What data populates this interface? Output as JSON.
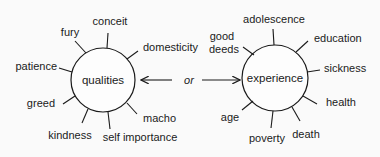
{
  "diagram": {
    "left": {
      "center": "qualities",
      "spokes": [
        "conceit",
        "fury",
        "domesticity",
        "patience",
        "greed",
        "kindness",
        "self importance",
        "macho"
      ]
    },
    "connector": {
      "label": "or"
    },
    "right": {
      "center": "experience",
      "spokes": [
        "adolescence",
        "good",
        "deeds",
        "education",
        "sickness",
        "health",
        "death",
        "poverty",
        "age"
      ]
    }
  }
}
